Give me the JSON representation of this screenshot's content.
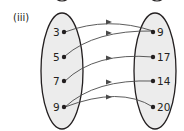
{
  "diagram": {
    "part_label": "(iii)",
    "type": "mapping-diagram",
    "domain": {
      "values": [
        "3",
        "5",
        "7",
        "9"
      ]
    },
    "range": {
      "values": [
        "9",
        "17",
        "14",
        "20"
      ]
    },
    "mappings": [
      {
        "from": "3",
        "to": "9"
      },
      {
        "from": "5",
        "to": "9"
      },
      {
        "from": "7",
        "to": "17"
      },
      {
        "from": "9",
        "to": "14"
      },
      {
        "from": "9",
        "to": "20"
      }
    ],
    "colors": {
      "ellipse_fill": "#ececec",
      "stroke": "#231f20",
      "arrow": "#4a4a4a"
    }
  }
}
